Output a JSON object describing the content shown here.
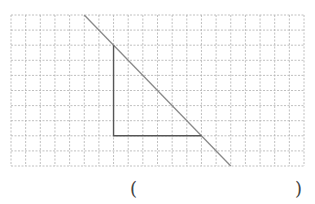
{
  "diagram": {
    "grid": {
      "columns": 20,
      "rows": 10
    },
    "diagonal_line": {
      "from": [
        5,
        0
      ],
      "to": [
        15,
        10
      ]
    },
    "triangle": {
      "vertices": [
        [
          7,
          2
        ],
        [
          7,
          8
        ],
        [
          13,
          8
        ]
      ]
    },
    "colors": {
      "grid": "#b0b0b0",
      "diagonal": "#8a8a8a",
      "triangle": "#555555"
    }
  },
  "answer": {
    "open_paren": "(",
    "close_paren": ")",
    "value": ""
  }
}
